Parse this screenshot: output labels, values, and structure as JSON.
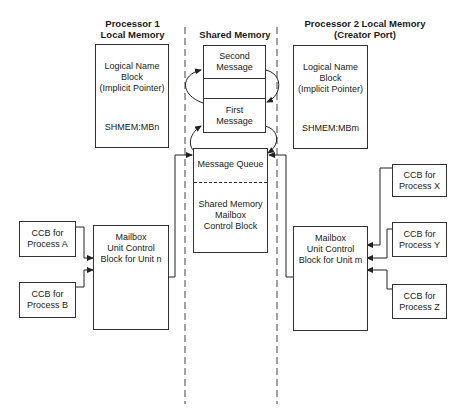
{
  "headers": {
    "processor1": [
      "Processor 1",
      "Local Memory"
    ],
    "shared": "Shared Memory",
    "processor2": [
      "Processor 2 Local Memory",
      "(Creator Port)"
    ]
  },
  "processor1_block": {
    "lines": [
      "Logical Name",
      "Block",
      "(Implicit Pointer)"
    ],
    "name": "SHMEM:MBn"
  },
  "processor2_block": {
    "lines": [
      "Logical Name",
      "Block",
      "(Implicit Pointer)"
    ],
    "name": "SHMEM:MBm"
  },
  "messages": {
    "second": [
      "Second",
      "Message"
    ],
    "first": [
      "First",
      "Message"
    ]
  },
  "shared_mailbox": {
    "queue": "Message Queue",
    "lines": [
      "Shared Memory",
      "Mailbox",
      "Control Block"
    ]
  },
  "mailbox_n": [
    "Mailbox",
    "Unit Control",
    "Block for Unit n"
  ],
  "mailbox_m": [
    "Mailbox",
    "Unit Control",
    "Block for Unit m"
  ],
  "ccbs": {
    "a": [
      "CCB for",
      "Process A"
    ],
    "b": [
      "CCB for",
      "Process B"
    ],
    "x": [
      "CCB for",
      "Process X"
    ],
    "y": [
      "CCB for",
      "Process Y"
    ],
    "z": [
      "CCB for",
      "Process Z"
    ]
  }
}
